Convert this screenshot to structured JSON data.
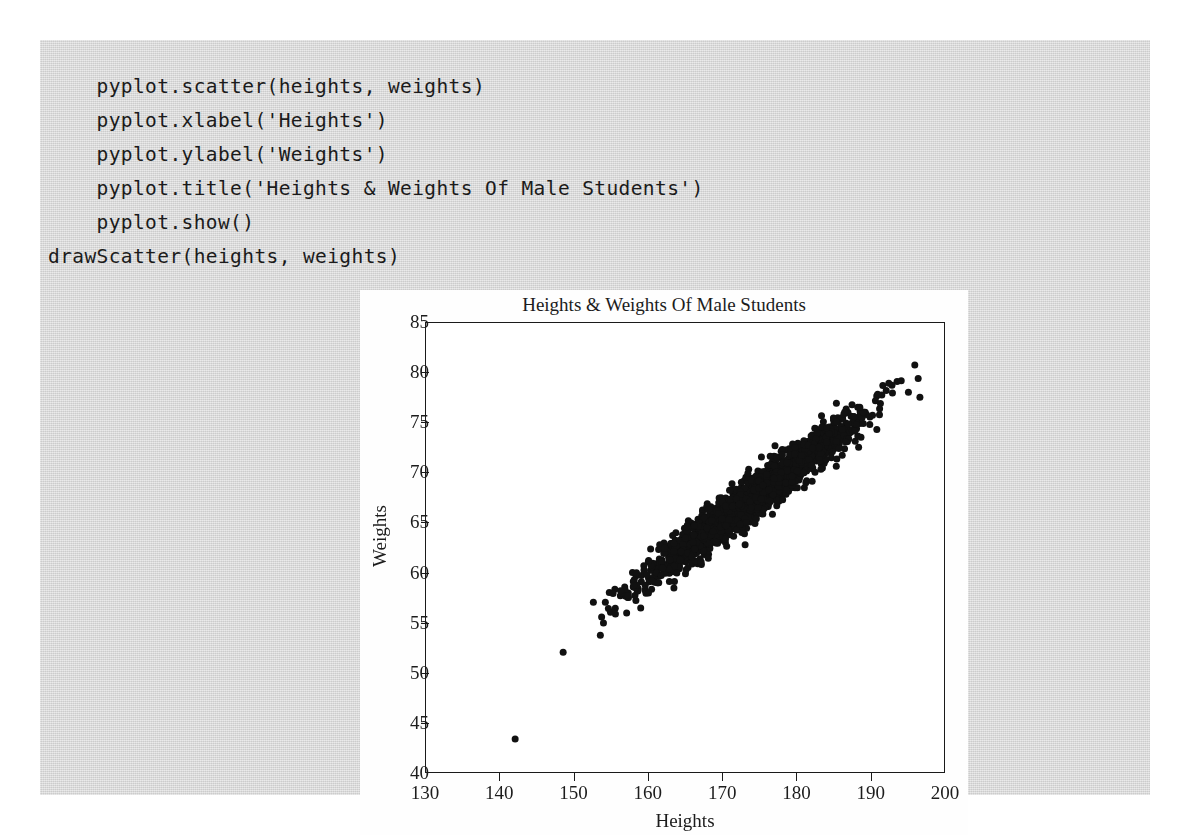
{
  "page": {
    "background": "#ffffff",
    "code_block_background": "#d9d9d9"
  },
  "code": {
    "language": "python",
    "lines": [
      "    pyplot.scatter(heights, weights)",
      "    pyplot.xlabel('Heights')",
      "    pyplot.ylabel('Weights')",
      "    pyplot.title('Heights & Weights Of Male Students')",
      "    pyplot.show()",
      "drawScatter(heights, weights)"
    ],
    "text": "    pyplot.scatter(heights, weights)\n    pyplot.xlabel('Heights')\n    pyplot.ylabel('Weights')\n    pyplot.title('Heights & Weights Of Male Students')\n    pyplot.show()\ndrawScatter(heights, weights)"
  },
  "chart_data": {
    "type": "scatter",
    "title": "Heights & Weights Of Male Students",
    "xlabel": "Heights",
    "ylabel": "Weights",
    "xlim": [
      130,
      200
    ],
    "ylim": [
      40,
      85
    ],
    "xticks": [
      130,
      140,
      150,
      160,
      170,
      180,
      190,
      200
    ],
    "yticks": [
      40,
      45,
      50,
      55,
      60,
      65,
      70,
      75,
      80,
      85
    ],
    "grid": false,
    "legend": null,
    "marker": {
      "shape": "circle",
      "color": "#111111",
      "size_px": 7
    },
    "n_points": 2000,
    "distribution": {
      "x_mean": 174.0,
      "x_std": 7.1,
      "correlation": 0.955,
      "slope": 0.555,
      "intercept": -29.0,
      "residual_std": 1.05,
      "x_range_bulk": [
        150,
        193
      ],
      "y_range_bulk": [
        48,
        79
      ]
    },
    "annotations": [
      {
        "label": "low outlier",
        "x": 142.0,
        "y": 43.5
      },
      {
        "label": "upper-right stragglers",
        "points": [
          [
            195.8,
            80.8
          ],
          [
            192.3,
            79.0
          ],
          [
            190.8,
            77.9
          ],
          [
            188.4,
            76.6
          ]
        ]
      }
    ]
  }
}
